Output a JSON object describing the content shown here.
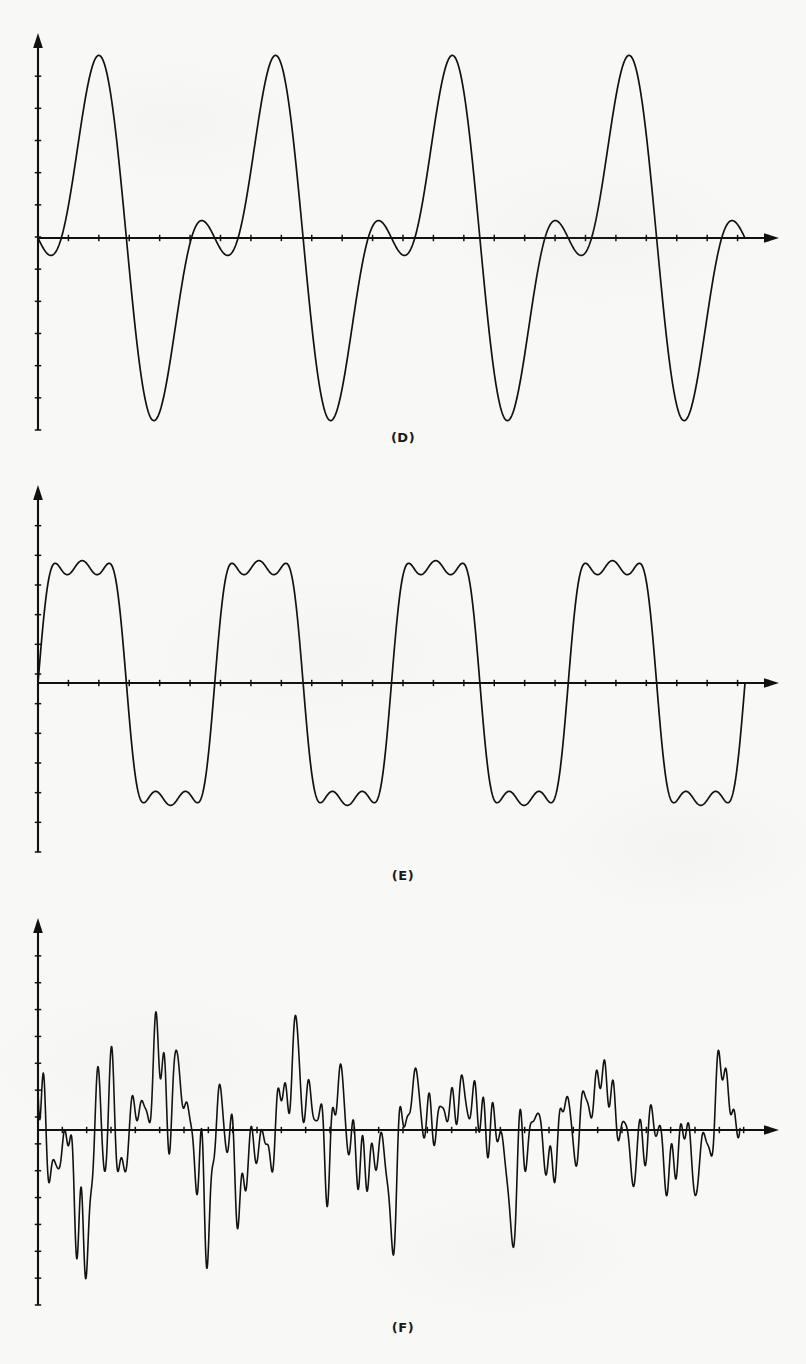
{
  "figure": {
    "kind": "waveform-figure-plate",
    "background_color": "#f8f8f7",
    "ink_color": "#111111",
    "panel_count": 3
  },
  "panels": [
    {
      "label": "(D)",
      "name": "panel-d",
      "description": "Periodic composite waveform: fundamental plus second harmonic, four cycles"
    },
    {
      "label": "(E)",
      "name": "panel-e",
      "description": "Periodic composite waveform with added higher harmonic producing small ripple near zero crossings, four cycles"
    },
    {
      "label": "(F)",
      "name": "panel-f",
      "description": "Complex decaying quasi-random multi-harmonic waveform"
    }
  ],
  "chart_data": [
    {
      "type": "line",
      "title": "(D)",
      "xlabel": "",
      "ylabel": "",
      "xlim": [
        0,
        4
      ],
      "ylim": [
        -1.08,
        1.08
      ],
      "grid": false,
      "legend": "none",
      "axis_style": "arrow-axes-with-ticks",
      "x_ticks": 24,
      "y_ticks": 12,
      "series": [
        {
          "name": "waveform-d",
          "formula": "0.62*sin(2*pi*x) + 0.46*sin(4*pi*x + pi)",
          "samples": 1200,
          "cycles": 4,
          "peak_positive": 0.86,
          "peak_negative": -1.0,
          "secondary_trough": -0.22,
          "start_value": 0.0
        }
      ]
    },
    {
      "type": "line",
      "title": "(E)",
      "xlabel": "",
      "ylabel": "",
      "xlim": [
        0,
        4
      ],
      "ylim": [
        -1.08,
        1.08
      ],
      "grid": false,
      "legend": "none",
      "axis_style": "arrow-axes-with-ticks",
      "x_ticks": 24,
      "y_ticks": 12,
      "series": [
        {
          "name": "waveform-e",
          "formula": "0.78*sin(2*pi*x) + 0.20*sin(6*pi*x) + 0.10*sin(10*pi*x)",
          "samples": 1600,
          "cycles": 4,
          "peak_positive": 0.88,
          "peak_negative": -0.95,
          "ripple_amplitude": 0.18,
          "start_value": 0.0
        }
      ]
    },
    {
      "type": "line",
      "title": "(F)",
      "xlabel": "",
      "ylabel": "",
      "xlim": [
        0,
        4
      ],
      "ylim": [
        -1.15,
        1.15
      ],
      "grid": false,
      "legend": "none",
      "axis_style": "arrow-axes-with-ticks",
      "x_ticks": 30,
      "y_ticks": 14,
      "series": [
        {
          "name": "waveform-f",
          "formula": "decaying sum of many harmonics (quasi-random speech-like signal)",
          "samples": 2400,
          "envelope": "exponential-decay",
          "peak_positive": 1.0,
          "peak_negative": -1.1,
          "start_value": 0.0
        }
      ]
    }
  ]
}
